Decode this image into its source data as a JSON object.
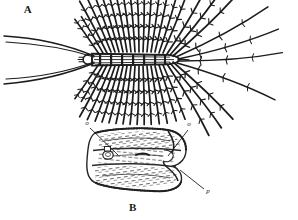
{
  "plate": {
    "title": "Zoological engraving plate",
    "background_color": "#ffffff",
    "ink_color": "#1c1c1c",
    "figures": [
      {
        "label": "A",
        "caption": "A",
        "subject": "house centipede, dorsal view with radiating legs",
        "label_position": {
          "x": 28,
          "y": 13
        }
      },
      {
        "label": "B",
        "caption": "B",
        "subject": "detail of body segment showing spiracle and process",
        "label_position": {
          "x": 133,
          "y": 211
        }
      }
    ],
    "part_labels": [
      {
        "text": "o",
        "x": 87,
        "y": 125,
        "leader_to": {
          "x": 112,
          "y": 152
        }
      },
      {
        "text": "o",
        "x": 189,
        "y": 126,
        "leader_to": {
          "x": 173,
          "y": 152
        }
      },
      {
        "text": "p",
        "x": 208,
        "y": 193,
        "leader_to": {
          "x": 186,
          "y": 175
        }
      }
    ]
  }
}
